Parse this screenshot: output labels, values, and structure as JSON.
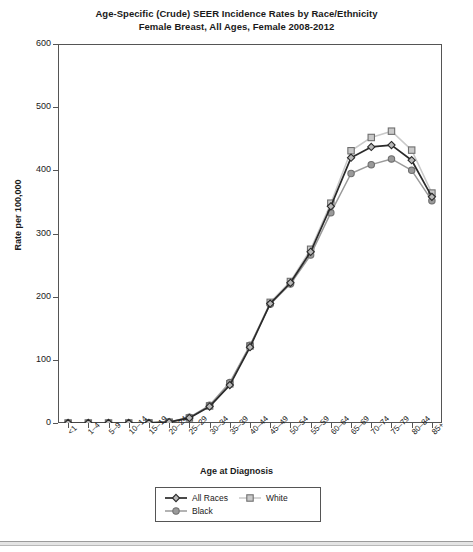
{
  "chart_data": {
    "type": "line",
    "title": "Age-Specific (Crude) SEER Incidence Rates by Race/Ethnicity",
    "subtitle": "Female Breast, All Ages, Female 2008-2012",
    "xlabel": "Age at Diagnosis",
    "ylabel": "Rate per 100,000",
    "ylim": [
      0,
      600
    ],
    "yticks": [
      0,
      100,
      200,
      300,
      400,
      500,
      600
    ],
    "grid": false,
    "legend_position": "bottom",
    "categories": [
      "<1",
      "1–4",
      "5–9",
      "10–14",
      "15–19",
      "20–24",
      "25–29",
      "30–34",
      "35–39",
      "40–44",
      "45–49",
      "50–54",
      "55–59",
      "60–64",
      "65–69",
      "70–74",
      "75–79",
      "80–84",
      "85+"
    ],
    "series": [
      {
        "name": "All Races",
        "color": "#2a2a2a",
        "marker": "diamond",
        "values": [
          0,
          0,
          0,
          0,
          0.2,
          1.4,
          8,
          26,
          60,
          120,
          189,
          222,
          271,
          343,
          420,
          437,
          440,
          416,
          358
        ]
      },
      {
        "name": "White",
        "color": "#c9c9c9",
        "marker": "square",
        "values": [
          0,
          0,
          0,
          0,
          0.2,
          1.3,
          8,
          27,
          62,
          122,
          191,
          224,
          275,
          348,
          431,
          452,
          462,
          432,
          364
        ]
      },
      {
        "name": "Black",
        "color": "#9a9a9a",
        "marker": "circle",
        "values": [
          0,
          0,
          0,
          0,
          0.2,
          1.6,
          9,
          28,
          64,
          123,
          188,
          220,
          266,
          333,
          395,
          409,
          418,
          400,
          352
        ]
      }
    ]
  }
}
